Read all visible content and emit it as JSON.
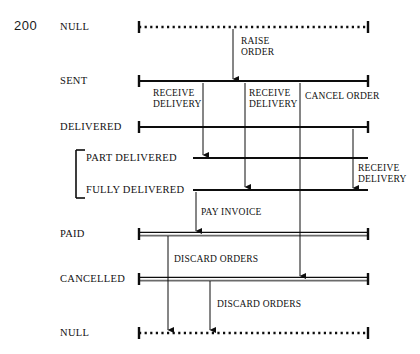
{
  "page": {
    "number": "200"
  },
  "diagram": {
    "type": "state-lifecycle-diagram",
    "colors": {
      "ink": "#0d0d0d",
      "double_line": "#6b6b6b",
      "background": "#ffffff"
    },
    "states": [
      {
        "id": "null-top",
        "label": "NULL",
        "y": 27,
        "line_style": "dotted",
        "x1": 139,
        "x2": 368,
        "caps": "both",
        "label_x": 60,
        "label_align": "left"
      },
      {
        "id": "sent",
        "label": "SENT",
        "y": 81,
        "line_style": "solid",
        "x1": 139,
        "x2": 368,
        "caps": "both",
        "label_x": 60,
        "label_align": "left"
      },
      {
        "id": "delivered",
        "label": "DELIVERED",
        "y": 127,
        "line_style": "solid",
        "x1": 139,
        "x2": 368,
        "caps": "both",
        "label_x": 60,
        "label_align": "left"
      },
      {
        "id": "part-delivered",
        "label": "PART DELIVERED",
        "y": 158,
        "line_style": "solid",
        "x1": 193,
        "x2": 368,
        "caps": "none",
        "label_x": 86,
        "label_align": "left"
      },
      {
        "id": "fully-delivered",
        "label": "FULLY DELIVERED",
        "y": 190,
        "line_style": "solid",
        "x1": 193,
        "x2": 368,
        "caps": "none",
        "label_x": 86,
        "label_align": "left"
      },
      {
        "id": "paid",
        "label": "PAID",
        "y": 234,
        "line_style": "double",
        "x1": 139,
        "x2": 368,
        "caps": "both",
        "label_x": 60,
        "label_align": "left"
      },
      {
        "id": "cancelled",
        "label": "CANCELLED",
        "y": 279,
        "line_style": "double",
        "x1": 139,
        "x2": 368,
        "caps": "both",
        "label_x": 60,
        "label_align": "left"
      },
      {
        "id": "null-bottom",
        "label": "NULL",
        "y": 333,
        "line_style": "dotted",
        "x1": 139,
        "x2": 368,
        "caps": "both",
        "label_x": 60,
        "label_align": "left"
      }
    ],
    "grouping_bracket": {
      "name": "part-fully-delivered-bracket",
      "x": 76,
      "y_top": 150,
      "y_bottom": 198,
      "tick_width": 9
    },
    "transitions": [
      {
        "id": "raise-order",
        "label": "RAISE\nORDER",
        "x": 233,
        "from_y": 29,
        "to_y": 79,
        "arrow": true,
        "label_x": 241,
        "label_y": 36
      },
      {
        "id": "receive-delivery-1",
        "label": "RECEIVE\nDELIVERY",
        "x": 203,
        "from_y": 83,
        "to_y": 155,
        "arrow": true,
        "label_x": 153,
        "label_y": 88
      },
      {
        "id": "receive-delivery-2",
        "label": "RECEIVE\nDELIVERY",
        "x": 245,
        "from_y": 83,
        "to_y": 187,
        "arrow": true,
        "label_x": 249,
        "label_y": 88
      },
      {
        "id": "cancel-order",
        "label": "CANCEL ORDER",
        "x": 300,
        "from_y": 83,
        "to_y": 276,
        "arrow": true,
        "label_x": 305,
        "label_y": 91
      },
      {
        "id": "receive-delivery-3",
        "label": "RECEIVE\nDELIVERY",
        "x": 353,
        "from_y": 129,
        "to_y": 188,
        "arrow": true,
        "label_x": 358,
        "label_y": 163
      },
      {
        "id": "pay-invoice",
        "label": "PAY INVOICE",
        "x": 196,
        "from_y": 192,
        "to_y": 231,
        "arrow": true,
        "label_x": 201,
        "label_y": 207
      },
      {
        "id": "discard-orders-1",
        "label": "DISCARD ORDERS",
        "x": 168,
        "from_y": 236,
        "to_y": 330,
        "arrow": true,
        "label_x": 174,
        "label_y": 254
      },
      {
        "id": "discard-orders-2",
        "label": "DISCARD ORDERS",
        "x": 210,
        "from_y": 281,
        "to_y": 330,
        "arrow": true,
        "label_x": 217,
        "label_y": 299
      }
    ]
  }
}
